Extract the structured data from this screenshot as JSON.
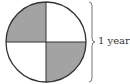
{
  "diagram": {
    "type": "quartered-circle",
    "quadrants": [
      {
        "position": "top-left",
        "shaded": true
      },
      {
        "position": "top-right",
        "shaded": false
      },
      {
        "position": "bottom-left",
        "shaded": false
      },
      {
        "position": "bottom-right",
        "shaded": true
      }
    ],
    "brace_label": "1 year",
    "colors": {
      "shaded": "#a3a3a3",
      "outline": "#333333",
      "background": "#ffffff"
    }
  }
}
